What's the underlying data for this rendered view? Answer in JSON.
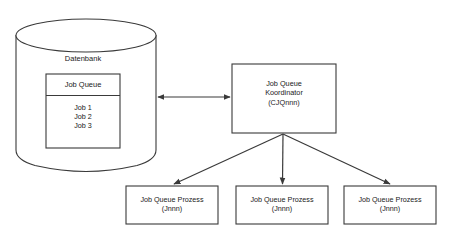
{
  "diagram": {
    "type": "flow-architecture",
    "background_color": "#ffffff",
    "stroke_color": "#3a3a3a",
    "text_color": "#1a1a1a",
    "database": {
      "caption": "Datenbank",
      "table": {
        "header": "Job Queue",
        "rows": [
          "Job 1",
          "Job 2",
          "Job 3"
        ]
      }
    },
    "coordinator": {
      "line1": "Job Queue",
      "line2": "Koordinator",
      "line3": "(CJQnnn)"
    },
    "processes": [
      {
        "line1": "Job Queue Prozess",
        "line2": "(Jnnn)"
      },
      {
        "line1": "Job Queue Prozess",
        "line2": "(Jnnn)"
      },
      {
        "line1": "Job Queue Prozess",
        "line2": "(Jnnn)"
      }
    ],
    "connectors": {
      "db_to_coordinator": "bidirectional-arrow",
      "coordinator_to_process": "arrow-down"
    }
  }
}
